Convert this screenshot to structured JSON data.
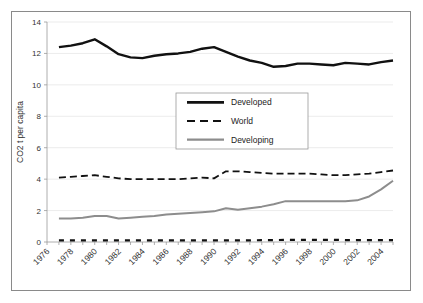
{
  "chart_data": {
    "type": "line",
    "title": "",
    "xlabel": "",
    "ylabel": "CO2 t per capita",
    "xlim": [
      1976,
      2005
    ],
    "ylim": [
      0,
      14
    ],
    "ytick_labels": [
      "0",
      "2",
      "4",
      "6",
      "8",
      "10",
      "12",
      "14"
    ],
    "yticks": [
      0,
      2,
      4,
      6,
      8,
      10,
      12,
      14
    ],
    "xtick_labels": [
      "1976",
      "1978",
      "1980",
      "1982",
      "1984",
      "1986",
      "1988",
      "1990",
      "1992",
      "1994",
      "1996",
      "1998",
      "2000",
      "2002",
      "2004"
    ],
    "xticks": [
      1976,
      1978,
      1980,
      1982,
      1984,
      1986,
      1988,
      1990,
      1992,
      1994,
      1996,
      1998,
      2000,
      2002,
      2004
    ],
    "grid": "horizontal",
    "legend_position": "center",
    "x": [
      1977,
      1978,
      1979,
      1980,
      1981,
      1982,
      1983,
      1984,
      1985,
      1986,
      1987,
      1988,
      1989,
      1990,
      1991,
      1992,
      1993,
      1994,
      1995,
      1996,
      1997,
      1998,
      1999,
      2000,
      2001,
      2002,
      2003,
      2004,
      2005
    ],
    "series": [
      {
        "name": "Developed",
        "style": "solid",
        "color": "#111111",
        "width": 2.4,
        "values": [
          12.4,
          12.5,
          12.65,
          12.9,
          12.45,
          11.95,
          11.75,
          11.7,
          11.85,
          11.95,
          12.0,
          12.1,
          12.3,
          12.4,
          12.1,
          11.8,
          11.55,
          11.4,
          11.15,
          11.2,
          11.35,
          11.35,
          11.3,
          11.25,
          11.4,
          11.35,
          11.3,
          11.45,
          11.55
        ]
      },
      {
        "name": "World",
        "style": "dashed",
        "color": "#111111",
        "width": 1.8,
        "values": [
          4.1,
          4.15,
          4.2,
          4.25,
          4.15,
          4.05,
          4.0,
          4.0,
          4.0,
          4.0,
          4.0,
          4.05,
          4.1,
          4.05,
          4.5,
          4.5,
          4.45,
          4.4,
          4.35,
          4.35,
          4.35,
          4.35,
          4.3,
          4.25,
          4.25,
          4.3,
          4.35,
          4.45,
          4.55
        ]
      },
      {
        "name": "Developing",
        "style": "solid",
        "color": "#8d8d8d",
        "width": 2.0,
        "values": [
          1.5,
          1.5,
          1.55,
          1.65,
          1.65,
          1.5,
          1.55,
          1.6,
          1.65,
          1.75,
          1.8,
          1.85,
          1.9,
          1.95,
          2.15,
          2.05,
          2.15,
          2.25,
          2.4,
          2.6,
          2.6,
          2.6,
          2.6,
          2.6,
          2.6,
          2.65,
          2.9,
          3.35,
          3.9
        ]
      },
      {
        "name": "",
        "style": "dashed-heavy",
        "color": "#111111",
        "width": 2.2,
        "values": [
          0.1,
          0.1,
          0.1,
          0.1,
          0.1,
          0.1,
          0.1,
          0.1,
          0.1,
          0.1,
          0.1,
          0.1,
          0.1,
          0.1,
          0.1,
          0.1,
          0.1,
          0.12,
          0.12,
          0.14,
          0.14,
          0.14,
          0.14,
          0.14,
          0.12,
          0.12,
          0.12,
          0.12,
          0.12
        ]
      }
    ],
    "legend_entries": [
      {
        "label": "Developed",
        "style": "solid",
        "color": "#111111",
        "width": 2.6
      },
      {
        "label": "World",
        "style": "dashed",
        "color": "#111111",
        "width": 2.0
      },
      {
        "label": "Developing",
        "style": "solid",
        "color": "#8d8d8d",
        "width": 2.2
      }
    ]
  }
}
